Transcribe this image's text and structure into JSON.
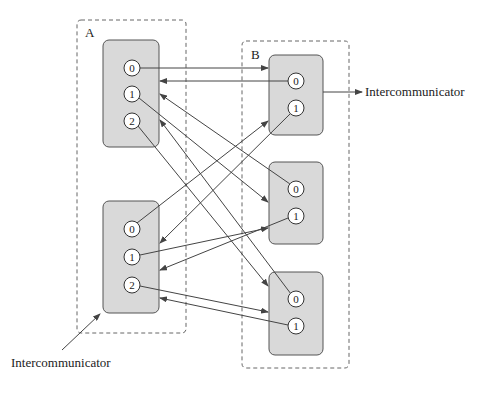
{
  "colors": {
    "stroke": "#444444",
    "box_fill": "#d9d9d9",
    "circle_fill": "#ffffff",
    "dash": "#666666"
  },
  "groups": [
    {
      "label": "A",
      "frame": {
        "x": 77,
        "y": 20,
        "w": 109,
        "h": 313
      },
      "label_pos": {
        "x": 85,
        "y": 37
      },
      "processes": [
        {
          "box": {
            "x": 103,
            "y": 40,
            "w": 56,
            "h": 107
          },
          "ranks": [
            {
              "label": "0",
              "cx": 132,
              "cy": 68
            },
            {
              "label": "1",
              "cx": 132,
              "cy": 94
            },
            {
              "label": "2",
              "cx": 132,
              "cy": 121
            }
          ]
        },
        {
          "box": {
            "x": 103,
            "y": 201,
            "w": 56,
            "h": 112
          },
          "ranks": [
            {
              "label": "0",
              "cx": 132,
              "cy": 229
            },
            {
              "label": "1",
              "cx": 132,
              "cy": 257
            },
            {
              "label": "2",
              "cx": 132,
              "cy": 285
            }
          ]
        }
      ]
    },
    {
      "label": "B",
      "frame": {
        "x": 242,
        "y": 41,
        "w": 107,
        "h": 327
      },
      "label_pos": {
        "x": 251,
        "y": 59
      },
      "processes": [
        {
          "box": {
            "x": 269,
            "y": 55,
            "w": 54,
            "h": 80
          },
          "ranks": [
            {
              "label": "0",
              "cx": 296,
              "cy": 81
            },
            {
              "label": "1",
              "cx": 296,
              "cy": 108
            }
          ]
        },
        {
          "box": {
            "x": 269,
            "y": 162,
            "w": 54,
            "h": 82
          },
          "ranks": [
            {
              "label": "0",
              "cx": 296,
              "cy": 189
            },
            {
              "label": "1",
              "cx": 296,
              "cy": 216
            }
          ]
        },
        {
          "box": {
            "x": 269,
            "y": 272,
            "w": 54,
            "h": 83
          },
          "ranks": [
            {
              "label": "0",
              "cx": 296,
              "cy": 299
            },
            {
              "label": "1",
              "cx": 296,
              "cy": 326
            }
          ]
        }
      ]
    }
  ],
  "arrows": [
    {
      "from": [
        140,
        68
      ],
      "to": [
        268,
        68
      ]
    },
    {
      "from": [
        288,
        81
      ],
      "to": [
        160,
        81
      ]
    },
    {
      "from": [
        139,
        98
      ],
      "to": [
        268,
        202
      ]
    },
    {
      "from": [
        290,
        184
      ],
      "to": [
        160,
        94
      ]
    },
    {
      "from": [
        138,
        126
      ],
      "to": [
        268,
        286
      ]
    },
    {
      "from": [
        291,
        294
      ],
      "to": [
        160,
        120
      ]
    },
    {
      "from": [
        137,
        223
      ],
      "to": [
        268,
        121
      ]
    },
    {
      "from": [
        291,
        113
      ],
      "to": [
        160,
        243
      ]
    },
    {
      "from": [
        140,
        255
      ],
      "to": [
        268,
        228
      ]
    },
    {
      "from": [
        288,
        218
      ],
      "to": [
        160,
        270
      ]
    },
    {
      "from": [
        140,
        286
      ],
      "to": [
        268,
        312
      ]
    },
    {
      "from": [
        288,
        325
      ],
      "to": [
        160,
        298
      ]
    }
  ],
  "annotations": [
    {
      "label": "Intercommunicator",
      "text_pos": {
        "x": 365,
        "y": 96
      },
      "arrow": {
        "from": [
          323,
          92
        ],
        "to": [
          362,
          92
        ]
      }
    },
    {
      "label": "Intercommunicator",
      "text_pos": {
        "x": 11,
        "y": 367
      },
      "arrow": {
        "from": [
          62,
          350
        ],
        "to": [
          100,
          314
        ]
      }
    }
  ]
}
